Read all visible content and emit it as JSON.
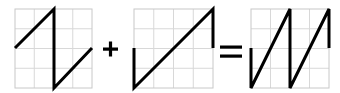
{
  "diagram": {
    "colors": {
      "wave": "#000000",
      "grid": "#d8d8d8",
      "frame": "#c8c8c8",
      "operator": "#000000"
    },
    "operators": [
      {
        "symbol": "plus",
        "label": "+"
      },
      {
        "symbol": "equals",
        "label": "="
      }
    ],
    "panels": [
      {
        "name": "panel-sawtooth-down",
        "box": [
          15,
          9,
          92,
          88
        ],
        "wave": [
          [
            15,
            48
          ],
          [
            54,
            9
          ],
          [
            54,
            88
          ],
          [
            92,
            48
          ]
        ]
      },
      {
        "name": "panel-ramp",
        "box": [
          134,
          9,
          213,
          88
        ],
        "wave": [
          [
            134,
            48
          ],
          [
            134,
            88
          ],
          [
            213,
            9
          ],
          [
            213,
            48
          ]
        ]
      },
      {
        "name": "panel-sum",
        "box": [
          251,
          9,
          329,
          88
        ],
        "wave": [
          [
            251,
            48
          ],
          [
            251,
            88
          ],
          [
            290,
            9
          ],
          [
            290,
            88
          ],
          [
            329,
            9
          ],
          [
            329,
            48
          ]
        ]
      }
    ]
  }
}
